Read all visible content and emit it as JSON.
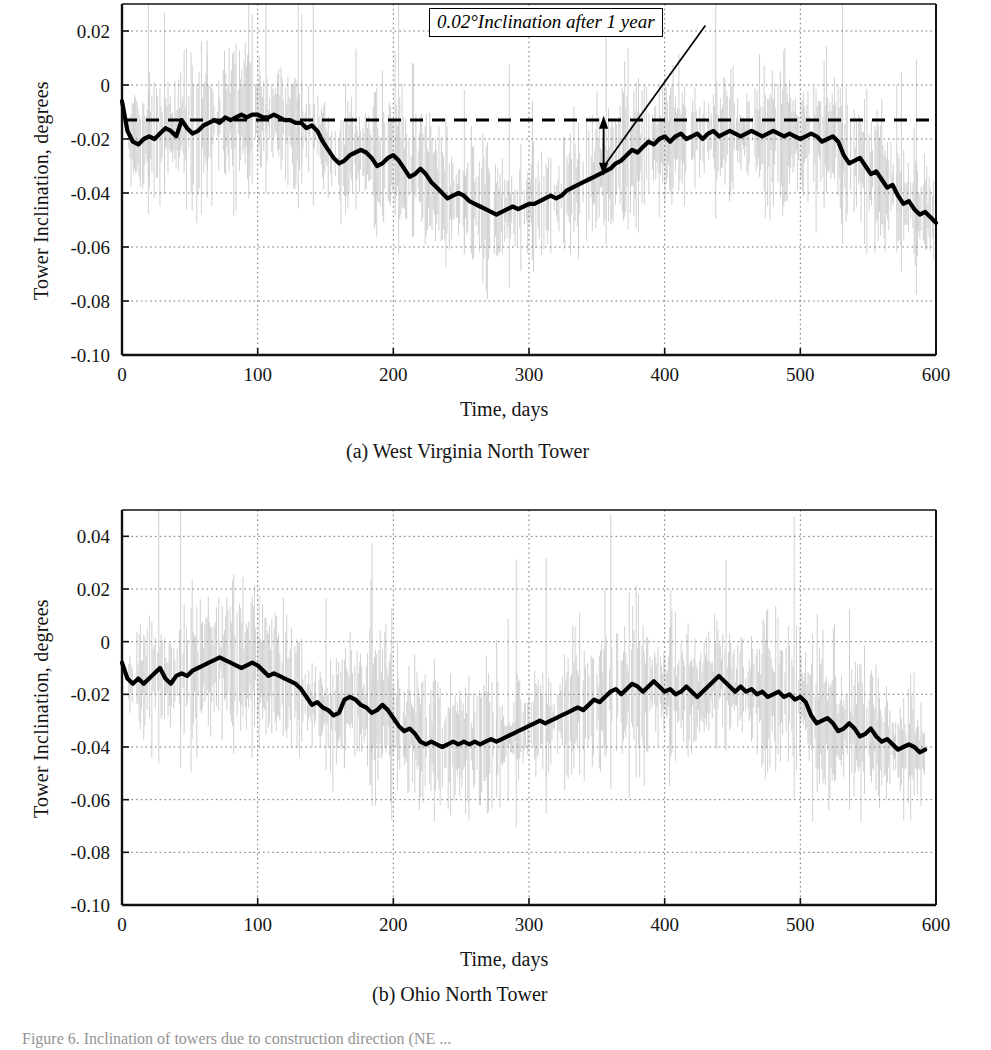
{
  "figure": {
    "caption": "Figure 6.  Inclination of towers due to construction direction (NE ...",
    "ylabel": "Tower Inclination, degrees",
    "xlabel": "Time, days",
    "annotation": "0.02°Inclination after 1 year",
    "panel_a_caption": "(a) West Virginia North Tower",
    "panel_b_caption": "(b) Ohio North Tower"
  },
  "colors": {
    "curve": "#000000",
    "noise": "#c9c9c9",
    "grid": "#6e6e6e",
    "axis": "#111111",
    "reference_line": "#000000",
    "background": "#ffffff"
  },
  "chart_data": [
    {
      "type": "line",
      "id": "west-virginia-north-tower",
      "title": "(a) West Virginia North Tower",
      "xlabel": "Time, days",
      "ylabel": "Tower Inclination, degrees",
      "xlim": [
        0,
        600
      ],
      "ylim": [
        -0.1,
        0.03
      ],
      "xticks": [
        0,
        100,
        200,
        300,
        400,
        500,
        600
      ],
      "yticks": [
        0.02,
        0,
        -0.02,
        -0.04,
        -0.06,
        -0.08,
        -0.1
      ],
      "ytick_labels": [
        "0.02",
        "0",
        "-0.02",
        "-0.04",
        "-0.06",
        "-0.08",
        "-0.10"
      ],
      "xtick_labels": [
        "0",
        "100",
        "200",
        "300",
        "400",
        "500",
        "600"
      ],
      "grid": true,
      "grid_style": "dotted",
      "legend": "none",
      "reference_line": {
        "y": -0.013,
        "style": "dashed",
        "label": "initial inclination datum"
      },
      "annotation": {
        "text": "0.02°Inclination after 1 year",
        "arrow_from_x": 430,
        "arrow_from_y": 0.022,
        "arrow_to_x": 355,
        "span_low": -0.031,
        "span_high": -0.014
      },
      "series": [
        {
          "name": "Smoothed tower inclination",
          "style": "thick-solid",
          "x": [
            0,
            4,
            8,
            12,
            16,
            20,
            24,
            28,
            32,
            36,
            40,
            44,
            48,
            52,
            56,
            60,
            64,
            68,
            72,
            76,
            80,
            84,
            88,
            92,
            96,
            100,
            104,
            108,
            112,
            116,
            120,
            124,
            128,
            132,
            136,
            140,
            144,
            148,
            152,
            156,
            160,
            164,
            168,
            172,
            176,
            180,
            184,
            188,
            192,
            196,
            200,
            204,
            208,
            212,
            216,
            220,
            224,
            228,
            232,
            236,
            240,
            244,
            248,
            252,
            256,
            260,
            264,
            268,
            272,
            276,
            280,
            284,
            288,
            292,
            296,
            300,
            304,
            308,
            312,
            316,
            320,
            324,
            328,
            332,
            336,
            340,
            344,
            348,
            352,
            356,
            360,
            364,
            368,
            372,
            376,
            380,
            384,
            388,
            392,
            396,
            400,
            404,
            408,
            412,
            416,
            420,
            424,
            428,
            432,
            436,
            440,
            444,
            448,
            452,
            456,
            460,
            464,
            468,
            472,
            476,
            480,
            484,
            488,
            492,
            496,
            500,
            504,
            508,
            512,
            516,
            520,
            524,
            528,
            532,
            536,
            540,
            544,
            548,
            552,
            556,
            560,
            564,
            568,
            572,
            576,
            580,
            584,
            588,
            592,
            596,
            600
          ],
          "y": [
            -0.006,
            -0.017,
            -0.021,
            -0.022,
            -0.02,
            -0.019,
            -0.02,
            -0.018,
            -0.016,
            -0.017,
            -0.019,
            -0.013,
            -0.016,
            -0.018,
            -0.017,
            -0.015,
            -0.014,
            -0.013,
            -0.014,
            -0.012,
            -0.013,
            -0.012,
            -0.011,
            -0.012,
            -0.011,
            -0.011,
            -0.012,
            -0.012,
            -0.011,
            -0.012,
            -0.013,
            -0.013,
            -0.014,
            -0.014,
            -0.016,
            -0.015,
            -0.017,
            -0.021,
            -0.024,
            -0.027,
            -0.029,
            -0.028,
            -0.026,
            -0.025,
            -0.024,
            -0.025,
            -0.027,
            -0.03,
            -0.029,
            -0.027,
            -0.026,
            -0.028,
            -0.031,
            -0.034,
            -0.033,
            -0.031,
            -0.033,
            -0.036,
            -0.038,
            -0.04,
            -0.042,
            -0.041,
            -0.04,
            -0.041,
            -0.043,
            -0.044,
            -0.045,
            -0.046,
            -0.047,
            -0.048,
            -0.047,
            -0.046,
            -0.045,
            -0.046,
            -0.045,
            -0.044,
            -0.044,
            -0.043,
            -0.042,
            -0.041,
            -0.042,
            -0.041,
            -0.039,
            -0.038,
            -0.037,
            -0.036,
            -0.035,
            -0.034,
            -0.033,
            -0.032,
            -0.031,
            -0.029,
            -0.028,
            -0.026,
            -0.024,
            -0.025,
            -0.023,
            -0.021,
            -0.022,
            -0.02,
            -0.019,
            -0.021,
            -0.019,
            -0.018,
            -0.02,
            -0.019,
            -0.018,
            -0.02,
            -0.018,
            -0.017,
            -0.019,
            -0.018,
            -0.017,
            -0.018,
            -0.019,
            -0.018,
            -0.017,
            -0.018,
            -0.019,
            -0.018,
            -0.017,
            -0.018,
            -0.019,
            -0.018,
            -0.019,
            -0.02,
            -0.019,
            -0.018,
            -0.019,
            -0.021,
            -0.02,
            -0.019,
            -0.021,
            -0.026,
            -0.029,
            -0.028,
            -0.027,
            -0.03,
            -0.033,
            -0.032,
            -0.035,
            -0.038,
            -0.037,
            -0.041,
            -0.044,
            -0.043,
            -0.046,
            -0.048,
            -0.047,
            -0.049,
            -0.051,
            -0.052
          ]
        },
        {
          "name": "Raw measurement scatter band",
          "style": "light-vertical-noise",
          "visible_range_x": [
            5,
            600
          ],
          "band_half_width_typical": 0.018
        }
      ]
    },
    {
      "type": "line",
      "id": "ohio-north-tower",
      "title": "(b) Ohio North Tower",
      "xlabel": "Time, days",
      "ylabel": "Tower Inclination, degrees",
      "xlim": [
        0,
        600
      ],
      "ylim": [
        -0.1,
        0.05
      ],
      "xticks": [
        0,
        100,
        200,
        300,
        400,
        500,
        600
      ],
      "yticks": [
        0.04,
        0.02,
        0,
        -0.02,
        -0.04,
        -0.06,
        -0.08,
        -0.1
      ],
      "ytick_labels": [
        "0.04",
        "0.02",
        "0",
        "-0.02",
        "-0.04",
        "-0.06",
        "-0.08",
        "-0.10"
      ],
      "xtick_labels": [
        "0",
        "100",
        "200",
        "300",
        "400",
        "500",
        "600"
      ],
      "grid": true,
      "grid_style": "dotted",
      "legend": "none",
      "series": [
        {
          "name": "Smoothed tower inclination",
          "style": "thick-solid",
          "x": [
            0,
            4,
            8,
            12,
            16,
            20,
            24,
            28,
            32,
            36,
            40,
            44,
            48,
            52,
            56,
            60,
            64,
            68,
            72,
            76,
            80,
            84,
            88,
            92,
            96,
            100,
            104,
            108,
            112,
            116,
            120,
            124,
            128,
            132,
            136,
            140,
            144,
            148,
            152,
            156,
            160,
            164,
            168,
            172,
            176,
            180,
            184,
            188,
            192,
            196,
            200,
            204,
            208,
            212,
            216,
            220,
            224,
            228,
            232,
            236,
            240,
            244,
            248,
            252,
            256,
            260,
            264,
            268,
            272,
            276,
            280,
            284,
            288,
            292,
            296,
            300,
            304,
            308,
            312,
            316,
            320,
            324,
            328,
            332,
            336,
            340,
            344,
            348,
            352,
            356,
            360,
            364,
            368,
            372,
            376,
            380,
            384,
            388,
            392,
            396,
            400,
            404,
            408,
            412,
            416,
            420,
            424,
            428,
            432,
            436,
            440,
            444,
            448,
            452,
            456,
            460,
            464,
            468,
            472,
            476,
            480,
            484,
            488,
            492,
            496,
            500,
            504,
            508,
            512,
            516,
            520,
            524,
            528,
            532,
            536,
            540,
            544,
            548,
            552,
            556,
            560,
            564,
            568,
            572,
            576,
            580,
            584,
            588,
            592,
            596,
            600
          ],
          "y": [
            -0.008,
            -0.014,
            -0.016,
            -0.014,
            -0.016,
            -0.014,
            -0.012,
            -0.01,
            -0.014,
            -0.016,
            -0.013,
            -0.012,
            -0.013,
            -0.011,
            -0.01,
            -0.009,
            -0.008,
            -0.007,
            -0.006,
            -0.007,
            -0.008,
            -0.009,
            -0.01,
            -0.009,
            -0.008,
            -0.009,
            -0.011,
            -0.013,
            -0.012,
            -0.013,
            -0.014,
            -0.015,
            -0.016,
            -0.018,
            -0.021,
            -0.024,
            -0.023,
            -0.025,
            -0.026,
            -0.028,
            -0.027,
            -0.022,
            -0.021,
            -0.022,
            -0.024,
            -0.025,
            -0.027,
            -0.026,
            -0.024,
            -0.026,
            -0.029,
            -0.032,
            -0.034,
            -0.033,
            -0.035,
            -0.038,
            -0.039,
            -0.038,
            -0.039,
            -0.04,
            -0.039,
            -0.038,
            -0.039,
            -0.038,
            -0.039,
            -0.038,
            -0.039,
            -0.038,
            -0.037,
            -0.038,
            -0.037,
            -0.036,
            -0.035,
            -0.034,
            -0.033,
            -0.032,
            -0.031,
            -0.03,
            -0.031,
            -0.03,
            -0.029,
            -0.028,
            -0.027,
            -0.026,
            -0.025,
            -0.026,
            -0.024,
            -0.022,
            -0.023,
            -0.021,
            -0.019,
            -0.018,
            -0.02,
            -0.018,
            -0.016,
            -0.017,
            -0.019,
            -0.017,
            -0.015,
            -0.017,
            -0.019,
            -0.018,
            -0.02,
            -0.019,
            -0.017,
            -0.019,
            -0.021,
            -0.019,
            -0.017,
            -0.015,
            -0.013,
            -0.015,
            -0.017,
            -0.019,
            -0.017,
            -0.019,
            -0.018,
            -0.02,
            -0.019,
            -0.021,
            -0.02,
            -0.019,
            -0.021,
            -0.02,
            -0.022,
            -0.021,
            -0.023,
            -0.028,
            -0.031,
            -0.03,
            -0.029,
            -0.031,
            -0.034,
            -0.033,
            -0.031,
            -0.033,
            -0.036,
            -0.035,
            -0.033,
            -0.036,
            -0.038,
            -0.037,
            -0.039,
            -0.041,
            -0.04,
            -0.039,
            -0.04,
            -0.042,
            -0.041
          ]
        },
        {
          "name": "Raw measurement scatter band",
          "style": "light-vertical-noise",
          "visible_range_x": [
            5,
            600
          ],
          "band_half_width_typical": 0.02
        }
      ]
    }
  ]
}
